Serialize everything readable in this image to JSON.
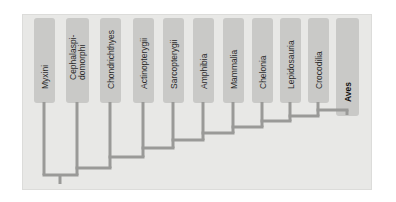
{
  "figure": {
    "type": "cladogram",
    "panel": {
      "background_color": "#e8e8e6",
      "border_color": "#dcdcda"
    },
    "colors": {
      "branch": "#9a9a98",
      "label_box": "#c9c9c7",
      "label_text": "#2b2b2b",
      "highlight_text": "#111111"
    }
  },
  "taxa": [
    {
      "id": "myxini",
      "label": "Myxini",
      "label_lines": [
        "Myxini"
      ],
      "bold": false,
      "x": 44,
      "box_x": 34,
      "box_y": 18,
      "box_w": 21,
      "box_h": 85
    },
    {
      "id": "cephalaspidomorphi",
      "label": "Cephalaspi- domorphi",
      "label_lines": [
        "Cephalaspi-",
        "domorphi"
      ],
      "bold": false,
      "x": 77,
      "box_x": 66,
      "box_y": 18,
      "box_w": 23,
      "box_h": 85
    },
    {
      "id": "chondrichthyes",
      "label": "Chondrichthyes",
      "label_lines": [
        "Chondrichthyes"
      ],
      "bold": false,
      "x": 110,
      "box_x": 100,
      "box_y": 18,
      "box_w": 21,
      "box_h": 85
    },
    {
      "id": "actinopterygii",
      "label": "Actinopterygii",
      "label_lines": [
        "Actinopterygii"
      ],
      "bold": false,
      "x": 143,
      "box_x": 133,
      "box_y": 18,
      "box_w": 21,
      "box_h": 85
    },
    {
      "id": "sarcopterygii",
      "label": "Sarcopterygii",
      "label_lines": [
        "Sarcopterygii"
      ],
      "bold": false,
      "x": 173,
      "box_x": 163,
      "box_y": 18,
      "box_w": 21,
      "box_h": 85
    },
    {
      "id": "amphibia",
      "label": "Amphibia",
      "label_lines": [
        "Amphibia"
      ],
      "bold": false,
      "x": 203,
      "box_x": 193,
      "box_y": 18,
      "box_w": 21,
      "box_h": 85
    },
    {
      "id": "mammalia",
      "label": "Mammalia",
      "label_lines": [
        "Mammalia"
      ],
      "bold": false,
      "x": 233,
      "box_x": 223,
      "box_y": 18,
      "box_w": 21,
      "box_h": 85
    },
    {
      "id": "chelonia",
      "label": "Chelonia",
      "label_lines": [
        "Chelonia"
      ],
      "bold": false,
      "x": 262,
      "box_x": 252,
      "box_y": 18,
      "box_w": 21,
      "box_h": 85
    },
    {
      "id": "lepidosauria",
      "label": "Lepidosauria",
      "label_lines": [
        "Lepidosauria"
      ],
      "bold": false,
      "x": 290,
      "box_x": 280,
      "box_y": 18,
      "box_w": 21,
      "box_h": 85
    },
    {
      "id": "crocodilia",
      "label": "Crocodilia",
      "label_lines": [
        "Crocodilia"
      ],
      "bold": false,
      "x": 318,
      "box_x": 308,
      "box_y": 18,
      "box_w": 21,
      "box_h": 85
    },
    {
      "id": "aves",
      "label": "Aves",
      "label_lines": [
        "Aves"
      ],
      "bold": true,
      "x": 347,
      "box_x": 336,
      "box_y": 18,
      "box_w": 23,
      "box_h": 98
    }
  ],
  "chart_data": {
    "type": "cladogram",
    "topology": "pectinate (comb) ladder; each successive taxon branches from a more recent node",
    "newick": "(Myxini,(Cephalaspidomorphi,(Chondrichthyes,(Actinopterygii,(Sarcopterygii,(Amphibia,(Mammalia,(Chelonia,(Lepidosauria,(Crocodilia,Aves)))))))))) ;",
    "tip_order": [
      "Myxini",
      "Cephalaspidomorphi",
      "Chondrichthyes",
      "Actinopterygii",
      "Sarcopterygii",
      "Amphibia",
      "Mammalia",
      "Chelonia",
      "Lepidosauria",
      "Crocodilia",
      "Aves"
    ],
    "highlighted_tip": "Aves",
    "nodes": [
      {
        "id": "n1",
        "depth": 1,
        "y": 175,
        "left_child": "Myxini",
        "right_child": "n2",
        "left_x": 44,
        "right_x": 77
      },
      {
        "id": "n2",
        "depth": 2,
        "y": 168,
        "left_child": "Cephalaspidomorphi",
        "right_child": "n3",
        "left_x": 77,
        "right_x": 110
      },
      {
        "id": "n3",
        "depth": 3,
        "y": 157,
        "left_child": "Chondrichthyes",
        "right_child": "n4",
        "left_x": 110,
        "right_x": 143
      },
      {
        "id": "n4",
        "depth": 4,
        "y": 148,
        "left_child": "Actinopterygii",
        "right_child": "n5",
        "left_x": 143,
        "right_x": 173
      },
      {
        "id": "n5",
        "depth": 5,
        "y": 140,
        "left_child": "Sarcopterygii",
        "right_child": "n6",
        "left_x": 173,
        "right_x": 203
      },
      {
        "id": "n6",
        "depth": 6,
        "y": 133,
        "left_child": "Amphibia",
        "right_child": "n7",
        "left_x": 203,
        "right_x": 233
      },
      {
        "id": "n7",
        "depth": 7,
        "y": 127,
        "left_child": "Mammalia",
        "right_child": "n8",
        "left_x": 233,
        "right_x": 262
      },
      {
        "id": "n8",
        "depth": 8,
        "y": 121,
        "left_child": "Chelonia",
        "right_child": "n9",
        "left_x": 262,
        "right_x": 290
      },
      {
        "id": "n9",
        "depth": 9,
        "y": 116,
        "left_child": "Lepidosauria",
        "right_child": "n10",
        "left_x": 290,
        "right_x": 318
      },
      {
        "id": "n10",
        "depth": 10,
        "y": 110,
        "left_child": "Crocodilia",
        "right_child": "Aves",
        "left_x": 318,
        "right_x": 347
      }
    ],
    "root": {
      "x": 60,
      "y_from": 175,
      "y_to": 184
    },
    "branch_width": 3,
    "axis": "none",
    "grid": false,
    "legend": "none"
  }
}
